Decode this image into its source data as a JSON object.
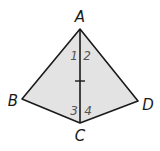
{
  "diagram": {
    "type": "geometry-figure",
    "fill_color": "#e3e3e3",
    "stroke_color": "#1a1a1a",
    "vertices": [
      {
        "id": "A",
        "label": "A",
        "x": 80,
        "y": 29,
        "label_x": 80,
        "label_y": 22
      },
      {
        "id": "B",
        "label": "B",
        "x": 22,
        "y": 99,
        "label_x": 13,
        "label_y": 106
      },
      {
        "id": "C",
        "label": "C",
        "x": 80,
        "y": 123,
        "label_x": 80,
        "label_y": 141
      },
      {
        "id": "D",
        "label": "D",
        "x": 138,
        "y": 101,
        "label_x": 148,
        "label_y": 110
      }
    ],
    "segments": [
      "AB",
      "BC",
      "CD",
      "DA",
      "AC"
    ],
    "tick_marks": [
      {
        "segment": "AC",
        "x": 80,
        "y": 81
      }
    ],
    "angle_labels": [
      {
        "label": "1",
        "x": 74,
        "y": 60
      },
      {
        "label": "2",
        "x": 86,
        "y": 60
      },
      {
        "label": "3",
        "x": 74,
        "y": 115
      },
      {
        "label": "4",
        "x": 87,
        "y": 115
      }
    ]
  }
}
